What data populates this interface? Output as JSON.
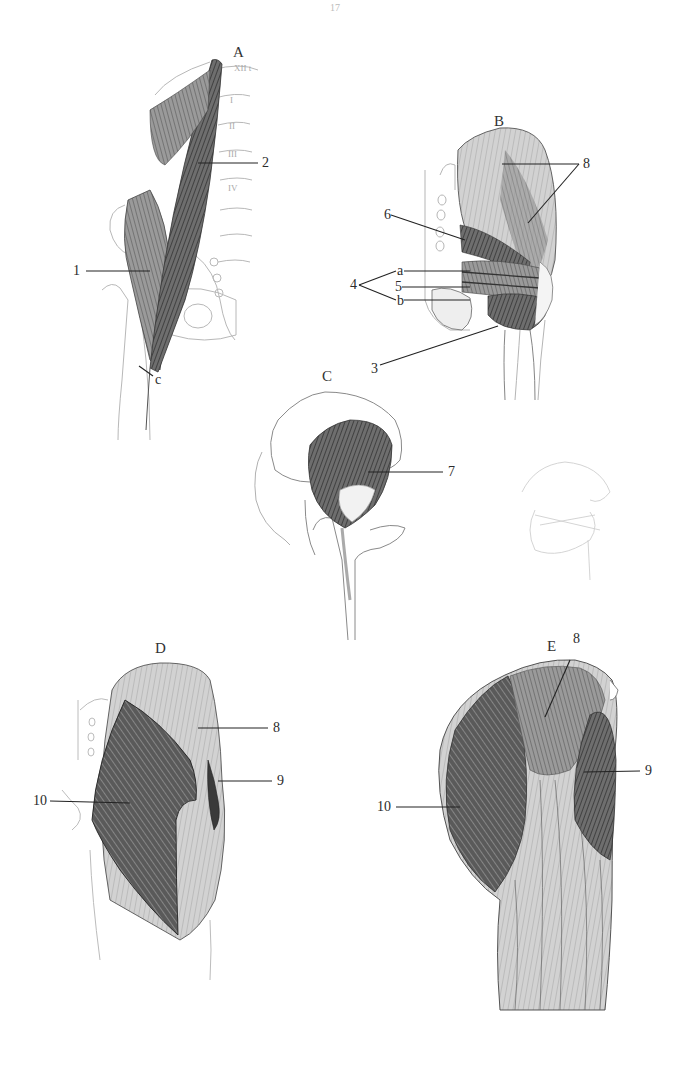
{
  "page": {
    "page_number": "17",
    "background": "#ffffff",
    "ink_color": "#2a2a2a"
  },
  "figures": {
    "A": {
      "letter": "A",
      "vertebra_labels": [
        "XII t",
        "I",
        "II",
        "III",
        "IV"
      ],
      "labels": {
        "l1": "1",
        "l2": "2",
        "lc": "c"
      }
    },
    "B": {
      "letter": "B",
      "labels": {
        "l8": "8",
        "l6": "6",
        "l4": "4",
        "la": "a",
        "l5": "5",
        "lb": "b",
        "l3": "3"
      }
    },
    "C": {
      "letter": "C",
      "labels": {
        "l7": "7"
      }
    },
    "D": {
      "letter": "D",
      "labels": {
        "l8": "8",
        "l9": "9",
        "l10": "10"
      }
    },
    "E": {
      "letter": "E",
      "labels": {
        "l8": "8",
        "l9": "9",
        "l10": "10"
      }
    }
  }
}
